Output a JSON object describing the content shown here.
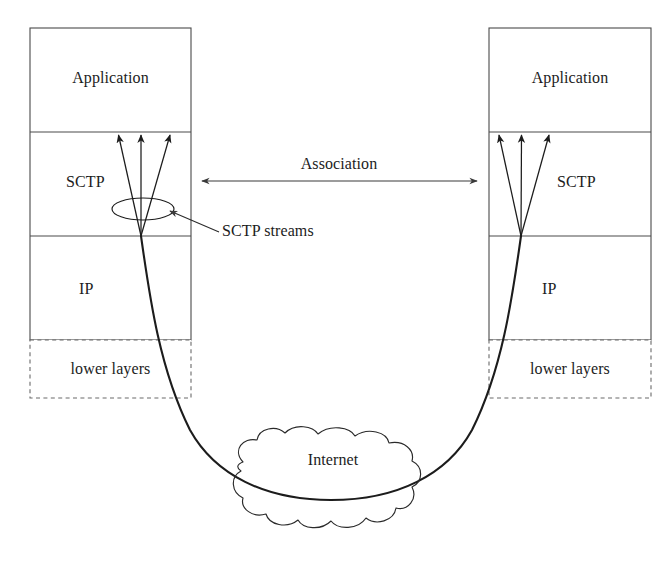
{
  "figure": {
    "colors": {
      "stroke": "#1c1c1c",
      "box_border": "#4a4a4a",
      "background": "#ffffff",
      "text": "#1c1c1c"
    }
  },
  "left_stack": {
    "name": "left endpoint protocol stack",
    "layers": [
      {
        "label": "Application",
        "style": "solid"
      },
      {
        "label": "SCTP",
        "style": "solid"
      },
      {
        "label": "IP",
        "style": "solid"
      },
      {
        "label": "lower layers",
        "style": "dashed"
      }
    ]
  },
  "right_stack": {
    "name": "right endpoint protocol stack",
    "layers": [
      {
        "label": "Application",
        "style": "solid"
      },
      {
        "label": "SCTP",
        "style": "solid"
      },
      {
        "label": "IP",
        "style": "solid"
      },
      {
        "label": "lower layers",
        "style": "dashed"
      }
    ]
  },
  "annotations": {
    "association": "Association",
    "streams": "SCTP streams",
    "internet": "Internet"
  },
  "streams": {
    "count_left": 3,
    "count_right": 3
  }
}
